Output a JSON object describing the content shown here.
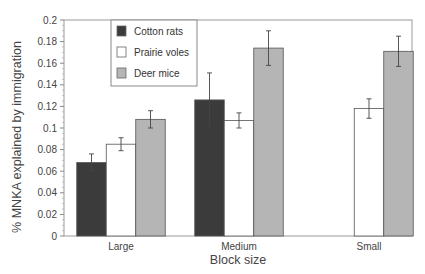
{
  "chart_data": {
    "type": "bar",
    "title": "",
    "xlabel": "Block size",
    "ylabel": "% MNKA explained by immigration",
    "ylim": [
      0,
      0.2
    ],
    "yticks": [
      0,
      0.02,
      0.04,
      0.06,
      0.08,
      0.1,
      0.12,
      0.14,
      0.16,
      0.18,
      0.2
    ],
    "ytick_labels": [
      "0",
      "0.02",
      "0.04",
      "0.06",
      "0.08",
      "0.1",
      "0.12",
      "0.14",
      "0.16",
      "0.18",
      "0.2"
    ],
    "categories": [
      "Large",
      "Medium",
      "Small"
    ],
    "grid": false,
    "legend_position": "upper-left-inside",
    "series": [
      {
        "name": "Cotton rats",
        "color": "#3b3b3b",
        "values": [
          0.068,
          0.126,
          0.0
        ],
        "errors": [
          0.008,
          0.025,
          0.0
        ]
      },
      {
        "name": "Prairie voles",
        "color": "#ffffff",
        "values": [
          0.085,
          0.107,
          0.118
        ],
        "errors": [
          0.006,
          0.007,
          0.009
        ]
      },
      {
        "name": "Deer mice",
        "color": "#b5b5b5",
        "values": [
          0.108,
          0.174,
          0.171
        ],
        "errors": [
          0.008,
          0.016,
          0.014
        ]
      }
    ]
  }
}
